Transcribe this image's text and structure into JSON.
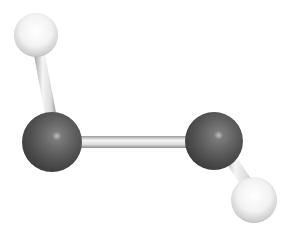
{
  "diagram": {
    "type": "ball-and-stick molecular model",
    "atoms": [
      {
        "id": "h1",
        "element": "H",
        "cx": 36,
        "cy": 35,
        "r": 22
      },
      {
        "id": "o1",
        "element": "O",
        "cx": 52,
        "cy": 142,
        "r": 30
      },
      {
        "id": "o2",
        "element": "O",
        "cx": 214,
        "cy": 141,
        "r": 29
      },
      {
        "id": "h2",
        "element": "H",
        "cx": 254,
        "cy": 200,
        "r": 23
      }
    ],
    "bonds": [
      {
        "from": "h1",
        "to": "o1"
      },
      {
        "from": "o1",
        "to": "o2"
      },
      {
        "from": "o2",
        "to": "h2"
      }
    ],
    "colors": {
      "background": "#ffffff",
      "heavy_atom": "#5a5a5a",
      "light_atom": "#f0f0f0",
      "bond": "#e6e6e6"
    }
  }
}
